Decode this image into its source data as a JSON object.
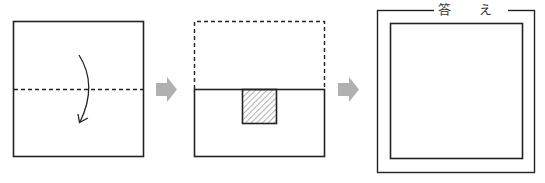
{
  "diagram": {
    "steps": [
      {
        "name": "original-square",
        "fold_line": "horizontal-dashed-center",
        "arrow": "fold-top-down"
      },
      {
        "name": "folded-rectangle",
        "cut_region": "hatched-square-top-center"
      },
      {
        "name": "answer-box"
      }
    ],
    "answer_label": "答 え",
    "colors": {
      "line": "#222222",
      "arrow": "#b0b0b0",
      "hatch": "#555555"
    }
  }
}
